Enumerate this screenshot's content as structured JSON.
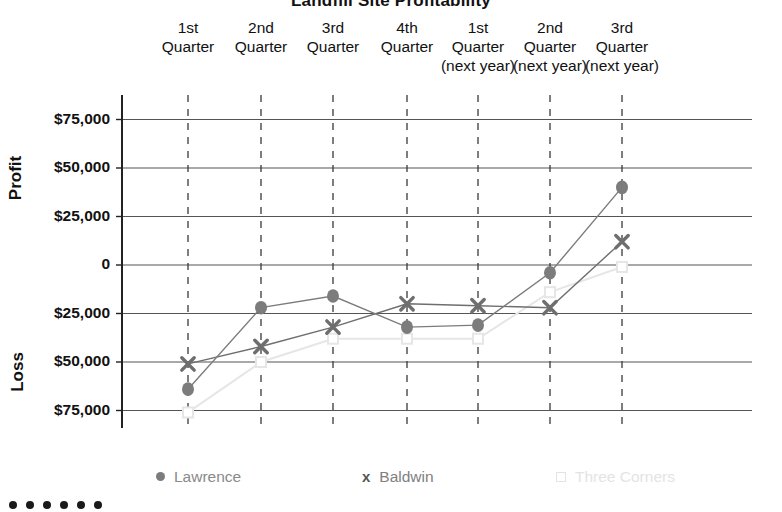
{
  "chart_data": {
    "type": "line",
    "title": "Landfill Site Profitability",
    "categories": [
      "1st Quarter",
      "2nd Quarter",
      "3rd Quarter",
      "4th Quarter",
      "1st Quarter (next year)",
      "2nd Quarter (next year)",
      "3rd Quarter (next year)"
    ],
    "category_lines": [
      [
        "1st",
        "Quarter"
      ],
      [
        "2nd",
        "Quarter"
      ],
      [
        "3rd",
        "Quarter"
      ],
      [
        "4th",
        "Quarter"
      ],
      [
        "1st",
        "Quarter",
        "(next year)"
      ],
      [
        "2nd",
        "Quarter",
        "(next year)"
      ],
      [
        "3rd",
        "Quarter",
        "(next year)"
      ]
    ],
    "series": [
      {
        "name": "Lawrence",
        "marker": "circle",
        "color": "#7c7c7c",
        "values": [
          -64000,
          -22000,
          -16000,
          -32000,
          -31000,
          -4000,
          40000
        ]
      },
      {
        "name": "Baldwin",
        "marker": "x",
        "color": "#6e6e6e",
        "values": [
          -51000,
          -42000,
          -32000,
          -20000,
          -21000,
          -22000,
          12000
        ]
      },
      {
        "name": "Three Corners",
        "marker": "square",
        "color": "#e6e6e6",
        "values": [
          -76000,
          -50000,
          -38000,
          -38000,
          -38000,
          -14000,
          -1000
        ]
      }
    ],
    "ylabel_top": "Profit",
    "ylabel_bottom": "Loss",
    "xlabel": "",
    "ylim": [
      -75000,
      75000
    ],
    "ytick_values": [
      75000,
      50000,
      25000,
      0,
      -25000,
      -50000,
      -75000
    ],
    "ytick_labels": [
      "$75,000",
      "$50,000",
      "$25,000",
      "0",
      "$25,000",
      "$50,000",
      "$75,000"
    ],
    "grid": {
      "horizontal": true,
      "vertical": true,
      "vertical_style": "dashed"
    },
    "legend_position": "bottom"
  },
  "legend": {
    "items": [
      {
        "label": "Lawrence",
        "marker": "circle-marker",
        "color": "#7c7c7c"
      },
      {
        "label": "Baldwin",
        "marker": "x-marker",
        "color": "#555555",
        "glyph": "x"
      },
      {
        "label": "Three Corners",
        "marker": "square-marker",
        "color": "#e4e4e4"
      }
    ]
  },
  "footer": {
    "bullet_count": 6
  },
  "colors": {
    "axis": "#222222",
    "grid": "#555555",
    "lawrence": "#7c7c7c",
    "baldwin": "#6e6e6e",
    "three_corners": "#e6e6e6",
    "text": "#111111"
  }
}
